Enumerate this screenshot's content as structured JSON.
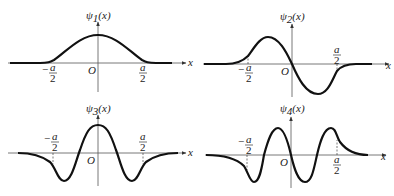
{
  "figure": {
    "panels": [
      {
        "id": "psi1",
        "ylabel": "ψ",
        "subscript": "1",
        "arg": "(x)",
        "xlabel": "x",
        "origin": "O",
        "neg_tick_num": "a",
        "neg_tick_sign": "−",
        "neg_tick_den": "2",
        "pos_tick_num": "a",
        "pos_tick_den": "2",
        "description": "Ground state: single positive hump centered at O, decaying outside ±a/2"
      },
      {
        "id": "psi2",
        "ylabel": "ψ",
        "subscript": "2",
        "arg": "(x)",
        "xlabel": "x",
        "origin": "O",
        "neg_tick_num": "a",
        "neg_tick_sign": "−",
        "neg_tick_den": "2",
        "pos_tick_num": "a",
        "pos_tick_den": "2",
        "description": "First excited state: positive lobe for x<0, negative lobe for x>0, one node at O"
      },
      {
        "id": "psi3",
        "ylabel": "ψ",
        "subscript": "3",
        "arg": "(x)",
        "xlabel": "x",
        "origin": "O",
        "neg_tick_num": "a",
        "neg_tick_sign": "−",
        "neg_tick_den": "2",
        "pos_tick_num": "a",
        "pos_tick_den": "2",
        "description": "Second excited state: central positive peak with two negative side lobes, two nodes"
      },
      {
        "id": "psi4",
        "ylabel": "ψ",
        "subscript": "4",
        "arg": "(x)",
        "xlabel": "x",
        "origin": "O",
        "neg_tick_num": "a",
        "neg_tick_sign": "−",
        "neg_tick_den": "2",
        "pos_tick_num": "a",
        "pos_tick_den": "2",
        "description": "Third excited state: alternating lobes (−,+,−,+), three nodes"
      }
    ]
  }
}
